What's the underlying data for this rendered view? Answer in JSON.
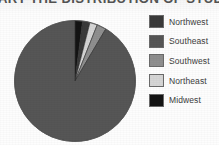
{
  "title": {
    "text": "ART THE DISTRIBUTION OF STUDENTS",
    "note_clipped": "top of image crops the title to its lowest pixel rows"
  },
  "legend": {
    "items": [
      {
        "label": "Northwest",
        "color": "#3a3a3a",
        "swatch_name": "legend-swatch-northwest"
      },
      {
        "label": "Southeast",
        "color": "#565656",
        "swatch_name": "legend-swatch-southeast"
      },
      {
        "label": "Southwest",
        "color": "#8f8f8f",
        "swatch_name": "legend-swatch-southwest"
      },
      {
        "label": "Northeast",
        "color": "#d5d5d5",
        "swatch_name": "legend-swatch-northeast"
      },
      {
        "label": "Midwest",
        "color": "#141414",
        "swatch_name": "legend-swatch-midwest"
      }
    ]
  },
  "chart_data": {
    "type": "pie",
    "title": "ART THE DISTRIBUTION OF STUDENTS",
    "categories": [
      "Northwest",
      "Southeast",
      "Southwest",
      "Northeast",
      "Midwest"
    ],
    "values": [
      2.0,
      91.5,
      2.5,
      2.0,
      2.0
    ],
    "unit": "percent",
    "colors": [
      "#3a3a3a",
      "#565656",
      "#8f8f8f",
      "#d5d5d5",
      "#141414"
    ],
    "start_angle_deg": 0,
    "direction": "clockwise",
    "legend_position": "right",
    "grid": false,
    "slice_order_clockwise_from_top": [
      "Midwest",
      "Northwest",
      "Northeast",
      "Southwest",
      "Southeast"
    ],
    "geometry": {
      "center_x": 75,
      "center_y": 81,
      "radius": 61
    }
  }
}
